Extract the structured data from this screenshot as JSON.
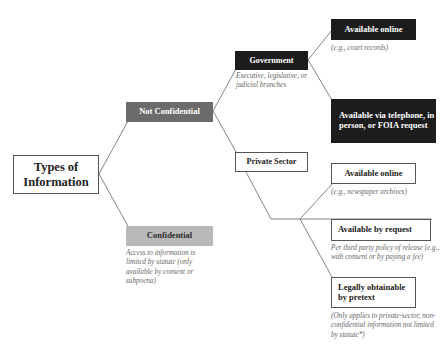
{
  "diagram": {
    "root": {
      "label": "Types of Information"
    },
    "not_confidential": {
      "label": "Not Confidential",
      "color": "#6b6b6b"
    },
    "confidential": {
      "label": "Confidential",
      "color": "#b9b9b9",
      "note": "Access to information is limited by statute (only available by consent or subpoena)"
    },
    "government": {
      "label": "Government",
      "color": "#1c1c1c",
      "note": "Executive, legislative, or judicial branches"
    },
    "private_sector": {
      "label": "Private Sector"
    },
    "gov_online": {
      "label": "Available online",
      "note": "(e.g., court records)"
    },
    "gov_request": {
      "label": "Available via telephone, in person, or FOIA request"
    },
    "priv_online": {
      "label": "Available online",
      "note": "(e.g., newspaper archives)"
    },
    "priv_request": {
      "label": "Available by request",
      "note": "Per third party policy of release (e.g., with consent or by paying a fee)"
    },
    "pretext": {
      "label": "Legally obtainable by pretext",
      "note": "(Only applies to private-sector, non-confidential information not limited by statute*)"
    }
  }
}
